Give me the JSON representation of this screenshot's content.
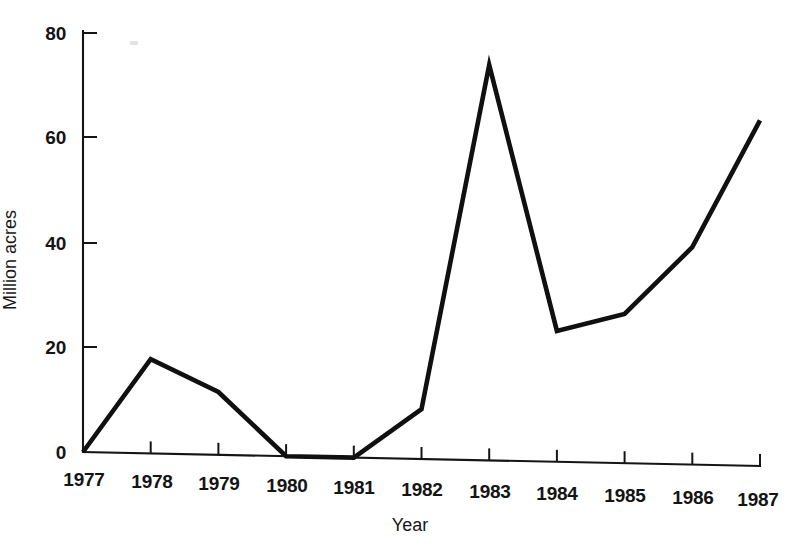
{
  "figure": {
    "background_color": "#ffffff",
    "ink_color": "#111111",
    "speck_label": ""
  },
  "chart_data": {
    "type": "line",
    "title": "",
    "xlabel": "Year",
    "ylabel": "Million acres",
    "categories": [
      "1977",
      "1978",
      "1979",
      "1980",
      "1981",
      "1982",
      "1983",
      "1984",
      "1985",
      "1986",
      "1987"
    ],
    "x": [
      1977,
      1978,
      1979,
      1980,
      1981,
      1982,
      1983,
      1984,
      1985,
      1986,
      1987
    ],
    "values": [
      0,
      18,
      12,
      0,
      0,
      9.5,
      75.5,
      25,
      28.5,
      41.5,
      66
    ],
    "series": [
      {
        "name": "Million acres",
        "values": [
          0,
          18,
          12,
          0,
          0,
          9.5,
          75.5,
          25,
          28.5,
          41.5,
          66
        ]
      }
    ],
    "ylim": [
      0,
      80
    ],
    "xlim": [
      1977,
      1987
    ],
    "yticks": [
      0,
      20,
      40,
      60,
      80
    ],
    "ytick_labels": [
      "0",
      "20",
      "40",
      "60",
      "80"
    ],
    "xticks": [
      1977,
      1978,
      1979,
      1980,
      1981,
      1982,
      1983,
      1984,
      1985,
      1986,
      1987
    ],
    "xtick_labels": [
      "1977",
      "1978",
      "1979",
      "1980",
      "1981",
      "1982",
      "1983",
      "1984",
      "1985",
      "1986",
      "1987"
    ],
    "grid": false,
    "legend": false,
    "legend_position": "none",
    "line_color": "#101010",
    "annotations": []
  }
}
